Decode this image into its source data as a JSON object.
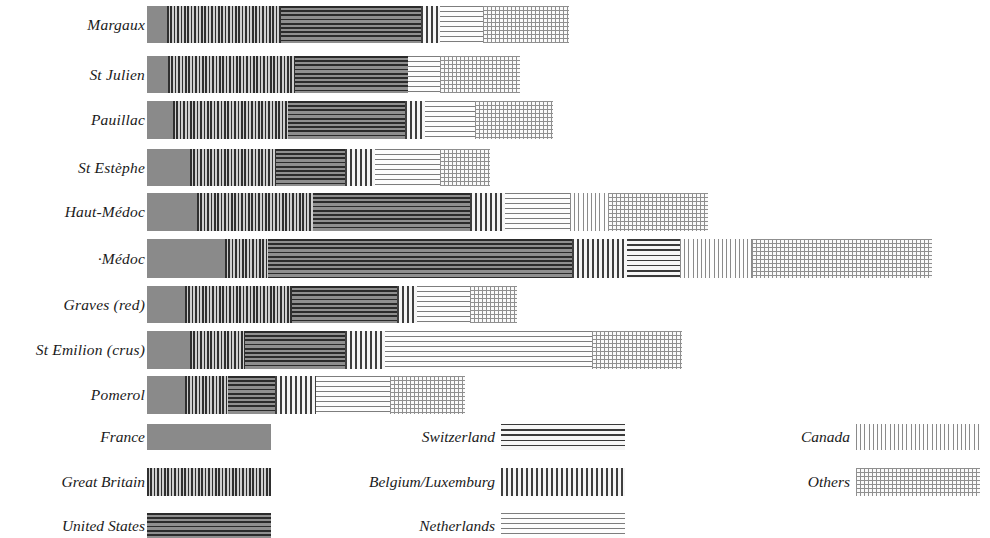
{
  "chart_data": {
    "type": "bar",
    "subtype": "stacked-horizontal",
    "title": "",
    "xlabel": "",
    "ylabel": "",
    "grid": false,
    "legend_position": "bottom",
    "units": "bar length (px at source scale)",
    "categories": [
      "Margaux",
      "St Julien",
      "Pauillac",
      "St Estèphe",
      "Haut-Médoc",
      "·Médoc",
      "Graves (red)",
      "St Emilion (crus)",
      "Pomerol"
    ],
    "series": [
      {
        "name": "France",
        "pattern": "solid-grey",
        "values": [
          20,
          21,
          26,
          43,
          50,
          78,
          38,
          43,
          38
        ]
      },
      {
        "name": "Great Britain",
        "pattern": "vertical-dense-dark",
        "values": [
          114,
          127,
          115,
          86,
          116,
          43,
          107,
          55,
          43
        ]
      },
      {
        "name": "United States",
        "pattern": "horizontal-dark",
        "values": [
          140,
          113,
          117,
          69,
          157,
          147,
          105,
          100,
          47
        ]
      },
      {
        "name": "Switzerland",
        "pattern": "horizontal-medium",
        "values": [
          0,
          0,
          0,
          0,
          0,
          53,
          0,
          0,
          0
        ]
      },
      {
        "name": "Belgium/Luxemburg",
        "pattern": "vertical-medium",
        "values": [
          19,
          0,
          20,
          30,
          35,
          55,
          20,
          40,
          41
        ]
      },
      {
        "name": "Netherlands",
        "pattern": "horizontal-light",
        "values": [
          43,
          32,
          50,
          65,
          65,
          0,
          53,
          207,
          74
        ]
      },
      {
        "name": "Canada",
        "pattern": "vertical-light",
        "values": [
          0,
          0,
          0,
          0,
          38,
          72,
          0,
          0,
          0
        ]
      },
      {
        "name": "Others",
        "pattern": "cross-hatch",
        "values": [
          86,
          80,
          78,
          50,
          100,
          180,
          47,
          90,
          75
        ]
      }
    ]
  },
  "bars": [
    {
      "label": "Margaux",
      "top": 6,
      "height": 37,
      "segments": [
        {
          "series": "France",
          "x": 0,
          "w": 20
        },
        {
          "series": "Great Britain",
          "x": 20,
          "w": 114
        },
        {
          "series": "United States",
          "x": 134,
          "w": 140
        },
        {
          "series": "Belgium/Luxemburg",
          "x": 274,
          "w": 19
        },
        {
          "series": "Netherlands",
          "x": 293,
          "w": 43
        },
        {
          "series": "Others",
          "x": 336,
          "w": 86
        }
      ]
    },
    {
      "label": "St Julien",
      "top": 56,
      "height": 37,
      "segments": [
        {
          "series": "France",
          "x": 0,
          "w": 21
        },
        {
          "series": "Great Britain",
          "x": 21,
          "w": 127
        },
        {
          "series": "United States",
          "x": 148,
          "w": 113
        },
        {
          "series": "Netherlands",
          "x": 261,
          "w": 32
        },
        {
          "series": "Others",
          "x": 293,
          "w": 80
        }
      ]
    },
    {
      "label": "Pauillac",
      "top": 101,
      "height": 38,
      "segments": [
        {
          "series": "France",
          "x": 0,
          "w": 26
        },
        {
          "series": "Great Britain",
          "x": 26,
          "w": 115
        },
        {
          "series": "United States",
          "x": 141,
          "w": 117
        },
        {
          "series": "Belgium/Luxemburg",
          "x": 258,
          "w": 20
        },
        {
          "series": "Netherlands",
          "x": 278,
          "w": 50
        },
        {
          "series": "Others",
          "x": 328,
          "w": 78
        }
      ]
    },
    {
      "label": "St Estèphe",
      "top": 149,
      "height": 37,
      "segments": [
        {
          "series": "France",
          "x": 0,
          "w": 43
        },
        {
          "series": "Great Britain",
          "x": 43,
          "w": 86
        },
        {
          "series": "United States",
          "x": 129,
          "w": 69
        },
        {
          "series": "Belgium/Luxemburg",
          "x": 198,
          "w": 30
        },
        {
          "series": "Netherlands",
          "x": 228,
          "w": 65
        },
        {
          "series": "Others",
          "x": 293,
          "w": 50
        }
      ]
    },
    {
      "label": "Haut-Médoc",
      "top": 193,
      "height": 38,
      "segments": [
        {
          "series": "France",
          "x": 0,
          "w": 50
        },
        {
          "series": "Great Britain",
          "x": 50,
          "w": 116
        },
        {
          "series": "United States",
          "x": 166,
          "w": 157
        },
        {
          "series": "Belgium/Luxemburg",
          "x": 323,
          "w": 35
        },
        {
          "series": "Netherlands",
          "x": 358,
          "w": 65
        },
        {
          "series": "Canada",
          "x": 423,
          "w": 38
        },
        {
          "series": "Others",
          "x": 461,
          "w": 100
        }
      ]
    },
    {
      "label": "·Médoc",
      "top": 239,
      "height": 39,
      "segments": [
        {
          "series": "France",
          "x": 0,
          "w": 78
        },
        {
          "series": "Great Britain",
          "x": 78,
          "w": 43
        },
        {
          "series": "United States",
          "x": 121,
          "w": 304
        },
        {
          "series": "Belgium/Luxemburg",
          "x": 425,
          "w": 55
        },
        {
          "series": "Switzerland",
          "x": 480,
          "w": 53
        },
        {
          "series": "Canada",
          "x": 533,
          "w": 72
        },
        {
          "series": "Others",
          "x": 605,
          "w": 180
        }
      ]
    },
    {
      "label": "Graves (red)",
      "top": 286,
      "height": 37,
      "segments": [
        {
          "series": "France",
          "x": 0,
          "w": 38
        },
        {
          "series": "Great Britain",
          "x": 38,
          "w": 107
        },
        {
          "series": "United States",
          "x": 145,
          "w": 105
        },
        {
          "series": "Belgium/Luxemburg",
          "x": 250,
          "w": 20
        },
        {
          "series": "Netherlands",
          "x": 270,
          "w": 53
        },
        {
          "series": "Others",
          "x": 323,
          "w": 47
        }
      ]
    },
    {
      "label": "St Emilion (crus)",
      "top": 331,
      "height": 38,
      "segments": [
        {
          "series": "France",
          "x": 0,
          "w": 43
        },
        {
          "series": "Great Britain",
          "x": 43,
          "w": 55
        },
        {
          "series": "United States",
          "x": 98,
          "w": 100
        },
        {
          "series": "Belgium/Luxemburg",
          "x": 198,
          "w": 40
        },
        {
          "series": "Netherlands",
          "x": 238,
          "w": 207
        },
        {
          "series": "Others",
          "x": 445,
          "w": 90
        }
      ]
    },
    {
      "label": "Pomerol",
      "top": 376,
      "height": 38,
      "segments": [
        {
          "series": "France",
          "x": 0,
          "w": 38
        },
        {
          "series": "Great Britain",
          "x": 38,
          "w": 43
        },
        {
          "series": "United States",
          "x": 81,
          "w": 47
        },
        {
          "series": "Belgium/Luxemburg",
          "x": 128,
          "w": 41
        },
        {
          "series": "Netherlands",
          "x": 169,
          "w": 74
        },
        {
          "series": "Others",
          "x": 243,
          "w": 75
        }
      ]
    }
  ],
  "legend": {
    "entries": [
      {
        "label": "France",
        "pattern": "solid-grey",
        "label_right": 845,
        "swatch_left": 147,
        "swatch_width": 124,
        "top": 424,
        "height": 26
      },
      {
        "label": "Great Britain",
        "pattern": "vertical-dense-dark",
        "label_right": 845,
        "swatch_left": 147,
        "swatch_width": 124,
        "top": 468,
        "height": 28
      },
      {
        "label": "United States",
        "pattern": "horizontal-dark",
        "label_right": 845,
        "swatch_left": 147,
        "swatch_width": 124,
        "top": 513,
        "height": 25
      },
      {
        "label": "Switzerland",
        "pattern": "horizontal-medium",
        "label_right": 495,
        "swatch_left": 501,
        "swatch_width": 124,
        "top": 424,
        "height": 26
      },
      {
        "label": "Belgium/Luxemburg",
        "pattern": "vertical-medium",
        "label_right": 495,
        "swatch_left": 501,
        "swatch_width": 124,
        "top": 468,
        "height": 28
      },
      {
        "label": "Netherlands",
        "pattern": "horizontal-light",
        "label_right": 495,
        "swatch_left": 501,
        "swatch_width": 124,
        "top": 513,
        "height": 25
      },
      {
        "label": "Canada",
        "pattern": "vertical-light",
        "label_right": 140,
        "swatch_left": 856,
        "swatch_width": 124,
        "top": 424,
        "height": 26
      },
      {
        "label": "Others",
        "pattern": "cross-hatch",
        "label_right": 140,
        "swatch_left": 856,
        "swatch_width": 124,
        "top": 468,
        "height": 28
      }
    ]
  },
  "colors": {
    "background": "#ffffff",
    "ink": "#1a1a1a",
    "solid_grey": "#8a8a8a",
    "dark_stripe": "#2f2f2f",
    "mid_stripe": "#3f3f3f",
    "light_stripe": "#8a8a8a"
  }
}
